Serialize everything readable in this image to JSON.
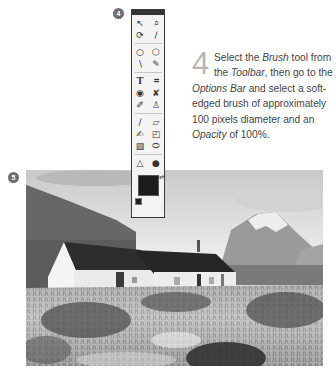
{
  "callouts": {
    "toolbar_badge": "4",
    "photo_badge": "5"
  },
  "toolbar": {
    "title": "Tools",
    "tools": [
      {
        "name": "move-tool",
        "glyph": "↖"
      },
      {
        "name": "zoom-tool",
        "glyph": "⌕"
      },
      {
        "name": "lasso-tool",
        "glyph": "⟳"
      },
      {
        "name": "eyedropper-tool",
        "glyph": "∕"
      },
      {
        "name": "elliptical-marquee-tool",
        "glyph": "○"
      },
      {
        "name": "polygonal-lasso-tool",
        "glyph": "⬡"
      },
      {
        "name": "magic-wand-tool",
        "glyph": "∖"
      },
      {
        "name": "quick-selection-tool",
        "glyph": "✎"
      },
      {
        "name": "type-tool",
        "glyph": "T"
      },
      {
        "name": "crop-tool",
        "glyph": "⌗"
      },
      {
        "name": "red-eye-tool",
        "glyph": "◉"
      },
      {
        "name": "spot-healing-tool",
        "glyph": "✘"
      },
      {
        "name": "smart-brush-tool",
        "glyph": "✐"
      },
      {
        "name": "clone-stamp-tool",
        "glyph": "♙"
      },
      {
        "name": "pencil-tool",
        "glyph": "∕"
      },
      {
        "name": "eraser-tool",
        "glyph": "▱"
      },
      {
        "name": "brush-tool",
        "glyph": "✍"
      },
      {
        "name": "paint-bucket-tool",
        "glyph": "◰"
      },
      {
        "name": "gradient-tool",
        "glyph": "▧"
      },
      {
        "name": "shape-tool",
        "glyph": "⬭"
      },
      {
        "name": "blur-tool",
        "glyph": "△"
      },
      {
        "name": "sponge-tool",
        "glyph": "●"
      }
    ],
    "foreground_color": "#1c1c1c",
    "swap_icon": "⇄"
  },
  "step": {
    "number": "4",
    "lines": [
      {
        "parts": [
          {
            "t": "Select the "
          },
          {
            "t": "Brush",
            "em": true
          },
          {
            "t": " tool from"
          }
        ]
      },
      {
        "parts": [
          {
            "t": "the "
          },
          {
            "t": "Toolbar",
            "em": true
          },
          {
            "t": ", then go to the"
          }
        ]
      },
      {
        "parts": [
          {
            "t": "Options Bar",
            "em": true
          },
          {
            "t": " and select a soft-"
          }
        ]
      },
      {
        "parts": [
          {
            "t": "edged brush of approximately"
          }
        ]
      },
      {
        "parts": [
          {
            "t": "100 pixels diameter and an"
          }
        ]
      },
      {
        "parts": [
          {
            "t": "Opacity",
            "em": true
          },
          {
            "t": " of 100%."
          }
        ]
      }
    ]
  },
  "photo": {
    "description": "Black-and-white landscape: whitewashed cottage with dark roof, snowy mountain, grassy foreground"
  }
}
